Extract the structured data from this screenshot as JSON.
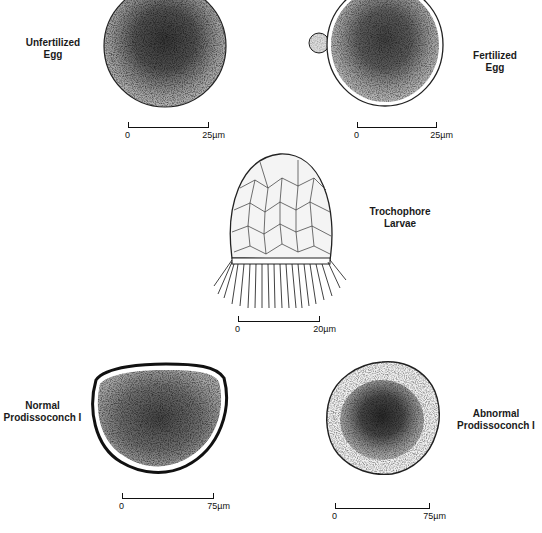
{
  "figure": {
    "panels": [
      {
        "id": "unfertilized-egg",
        "label": "Unfertilized\nEgg",
        "scale": {
          "zero": "0",
          "end": "25µm"
        }
      },
      {
        "id": "fertilized-egg",
        "label": "Fertilized\nEgg",
        "scale": {
          "zero": "0",
          "end": "25µm"
        }
      },
      {
        "id": "trochophore-larvae",
        "label": "Trochophore\nLarvae",
        "scale": {
          "zero": "0",
          "end": "20µm"
        }
      },
      {
        "id": "normal-prodissoconch",
        "label": "Normal\nProdissoconch I",
        "scale": {
          "zero": "0",
          "end": "75µm"
        }
      },
      {
        "id": "abnormal-prodissoconch",
        "label": "Abnormal\nProdissoconch I",
        "scale": {
          "zero": "0",
          "end": "75µm"
        }
      }
    ]
  }
}
